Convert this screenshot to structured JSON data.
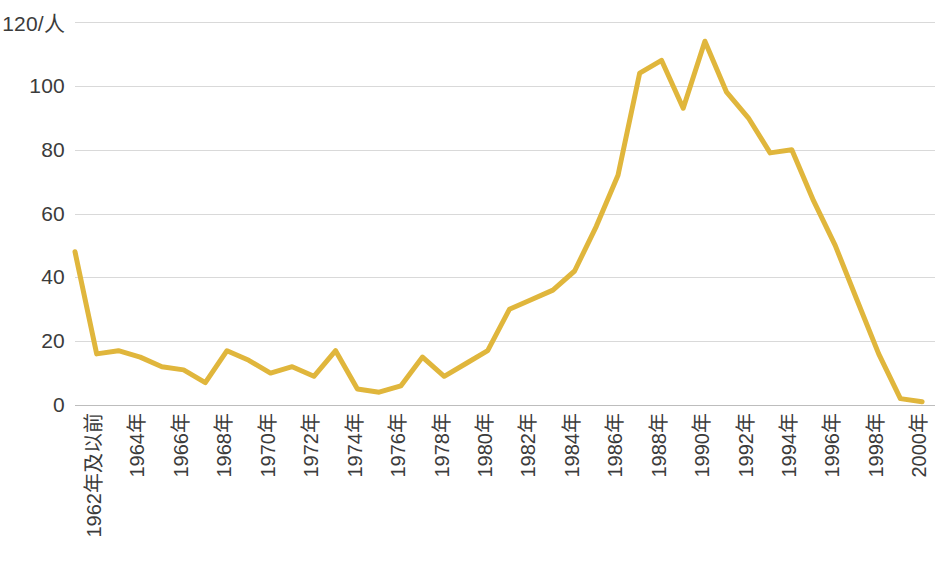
{
  "chart_data": {
    "type": "line",
    "title": "",
    "subtitle": "",
    "xlabel": "",
    "ylabel": "",
    "yunit": "/人",
    "ylim": [
      0,
      120
    ],
    "yticks": [
      0,
      20,
      40,
      60,
      80,
      100,
      120
    ],
    "ytick_labels": [
      "0",
      "20",
      "40",
      "60",
      "80",
      "100",
      "120/人"
    ],
    "grid": true,
    "legend": false,
    "legend_position": "none",
    "line_color": "#E0B63C",
    "line_width": 5,
    "x_tick_labels": [
      "1962年及以前",
      "1964年",
      "1966年",
      "1968年",
      "1970年",
      "1972年",
      "1974年",
      "1976年",
      "1978年",
      "1980年",
      "1982年",
      "1984年",
      "1986年",
      "1988年",
      "1990年",
      "1992年",
      "1994年",
      "1996年",
      "1998年",
      "2000年"
    ],
    "x": [
      1962,
      1963,
      1964,
      1965,
      1966,
      1967,
      1968,
      1969,
      1970,
      1971,
      1972,
      1973,
      1974,
      1975,
      1976,
      1977,
      1978,
      1979,
      1980,
      1981,
      1982,
      1983,
      1984,
      1985,
      1986,
      1987,
      1988,
      1989,
      1990,
      1991,
      1992,
      1993,
      1994,
      1995,
      1996,
      1997,
      1998,
      1999,
      2000,
      2001
    ],
    "categories": [
      "1962年及以前",
      "1963",
      "1964",
      "1965",
      "1966",
      "1967",
      "1968",
      "1969",
      "1970",
      "1971",
      "1972",
      "1973",
      "1974",
      "1975",
      "1976",
      "1977",
      "1978",
      "1979",
      "1980",
      "1981",
      "1982",
      "1983",
      "1984",
      "1985",
      "1986",
      "1987",
      "1988",
      "1989",
      "1990",
      "1991",
      "1992",
      "1993",
      "1994",
      "1995",
      "1996",
      "1997",
      "1998",
      "1999",
      "2000",
      "2001"
    ],
    "values": [
      48,
      16,
      17,
      15,
      12,
      11,
      7,
      17,
      14,
      10,
      12,
      9,
      17,
      5,
      4,
      6,
      15,
      9,
      13,
      17,
      30,
      33,
      36,
      42,
      56,
      72,
      104,
      108,
      93,
      114,
      98,
      90,
      79,
      80,
      64,
      50,
      33,
      16,
      2,
      1
    ],
    "series": [
      {
        "name": "人数",
        "values": [
          48,
          16,
          17,
          15,
          12,
          11,
          7,
          17,
          14,
          10,
          12,
          9,
          17,
          5,
          4,
          6,
          15,
          9,
          13,
          17,
          30,
          33,
          36,
          42,
          56,
          72,
          104,
          108,
          93,
          114,
          98,
          90,
          79,
          80,
          64,
          50,
          33,
          16,
          2,
          1
        ]
      }
    ],
    "annotations": []
  }
}
